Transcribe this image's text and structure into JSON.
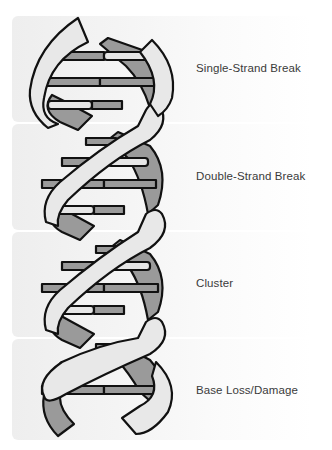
{
  "diagram": {
    "type": "dna-double-helix-damage-types",
    "panels": [
      {
        "id": "ssb",
        "label": "Single-Strand Break"
      },
      {
        "id": "dsb",
        "label": "Double-Strand Break"
      },
      {
        "id": "cluster",
        "label": "Cluster"
      },
      {
        "id": "base",
        "label": "Base Loss/Damage"
      }
    ],
    "colors": {
      "strand_front": "#e8e8e8",
      "strand_back": "#9a9a9a",
      "rung_dark": "#9a9a9a",
      "rung_light": "#e6e6e6",
      "outline": "#111111",
      "text": "#3a3a3a"
    }
  }
}
